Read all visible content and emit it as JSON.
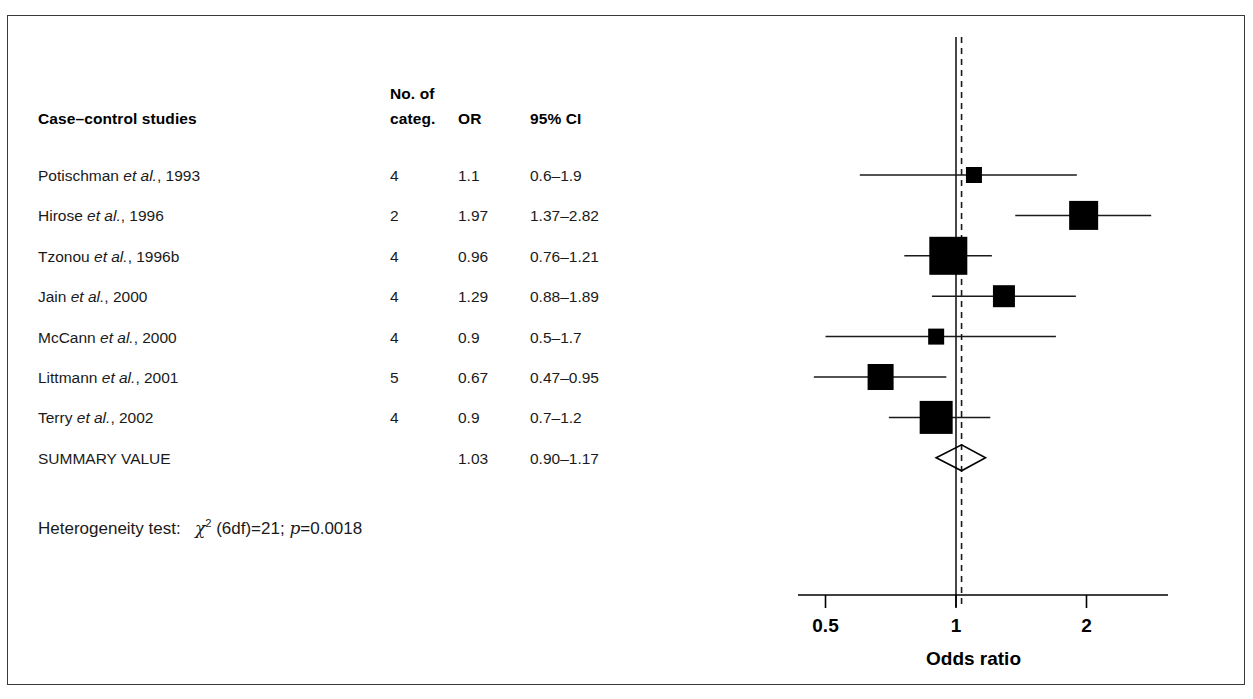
{
  "figure": {
    "headers": {
      "study": "Case–control studies",
      "categ_line1": "No. of",
      "categ_line2": "categ.",
      "or": "OR",
      "ci": "95% CI"
    },
    "heterogeneity": {
      "label": "Heterogeneity test:",
      "stat_symbol": "χ",
      "stat_sup": "2",
      "stat_rest": " (6df)=21;",
      "p_symbol": "p",
      "p_value": "=0.0018"
    },
    "summary_label": "SUMMARY VALUE"
  },
  "chart_data": {
    "type": "forest",
    "title": "",
    "xlabel": "Odds ratio",
    "ylabel": "",
    "xscale": "log",
    "xticks": [
      0.5,
      1,
      2
    ],
    "xtick_labels": [
      "0.5",
      "1",
      "2"
    ],
    "xlim": [
      0.43,
      2.5
    ],
    "reference_line": 1,
    "summary_line": 1.03,
    "grid": false,
    "legend": "none",
    "rows": [
      {
        "study": "Potischman",
        "study_suffix": " et al., 1993",
        "label": "Potischman et al., 1993",
        "categ": "4",
        "or_text": "1.1",
        "ci_text": "0.6–1.9",
        "or": 1.1,
        "lo": 0.6,
        "hi": 1.9,
        "marker": 16
      },
      {
        "study": "Hirose",
        "study_suffix": " et al., 1996",
        "label": "Hirose et al., 1996",
        "categ": "2",
        "or_text": "1.97",
        "ci_text": "1.37–2.82",
        "or": 1.97,
        "lo": 1.37,
        "hi": 2.82,
        "marker": 29
      },
      {
        "study": "Tzonou",
        "study_suffix": " et al., 1996b",
        "label": "Tzonou et al., 1996b",
        "categ": "4",
        "or_text": "0.96",
        "ci_text": "0.76–1.21",
        "or": 0.96,
        "lo": 0.76,
        "hi": 1.21,
        "marker": 38
      },
      {
        "study": "Jain",
        "study_suffix": " et al., 2000",
        "label": "Jain et al., 2000",
        "categ": "4",
        "or_text": "1.29",
        "ci_text": "0.88–1.89",
        "or": 1.29,
        "lo": 0.88,
        "hi": 1.89,
        "marker": 22
      },
      {
        "study": "McCann",
        "study_suffix": " et al., 2000",
        "label": "McCann et al., 2000",
        "categ": "4",
        "or_text": "0.9",
        "ci_text": "0.5–1.7",
        "or": 0.9,
        "lo": 0.5,
        "hi": 1.7,
        "marker": 16
      },
      {
        "study": "Littmann",
        "study_suffix": " et al., 2001",
        "label": "Littmann et al., 2001",
        "categ": "5",
        "or_text": "0.67",
        "ci_text": "0.47–0.95",
        "or": 0.67,
        "lo": 0.47,
        "hi": 0.95,
        "marker": 26
      },
      {
        "study": "Terry",
        "study_suffix": " et al., 2002",
        "label": "Terry et al., 2002",
        "categ": "4",
        "or_text": "0.9",
        "ci_text": "0.7–1.2",
        "or": 0.9,
        "lo": 0.7,
        "hi": 1.2,
        "marker": 33
      }
    ],
    "summary": {
      "label": "SUMMARY VALUE",
      "categ": "",
      "or_text": "1.03",
      "ci_text": "0.90–1.17",
      "or": 1.03,
      "lo": 0.9,
      "hi": 1.17
    },
    "colors": {
      "marker": "#000000",
      "line": "#1a1a1a",
      "reference": "#1a1a1a",
      "summary_line": "#1a1a1a",
      "text": "#000000",
      "frame": "#3a3a3a"
    }
  }
}
